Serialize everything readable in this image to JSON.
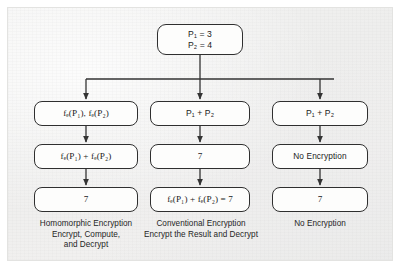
{
  "figure": {
    "background_color": "#f0f0ef",
    "box_border_color": "#2f2f2f",
    "box_fill_color": "#fdfdfc",
    "connector_color": "#333333"
  },
  "root": {
    "line1": "P₁ = 3",
    "line2": "P₂ = 4"
  },
  "columns": [
    {
      "id": "homomorphic",
      "step1": "fₑ(P₁), fₑ(P₂)",
      "step2": "fₑ(P₁) + fₑ(P₂)",
      "step3": "7",
      "caption_line1": "Homomorphic Encryption",
      "caption_line2": "Encrypt, Compute,",
      "caption_line3": "and Decrypt"
    },
    {
      "id": "conventional",
      "step1": "P₁ + P₂",
      "step2": "7",
      "step3": "fₑ(P₁) + fₑ(P₂) = 7",
      "caption_line1": "Conventional Encryption",
      "caption_line2": "Encrypt the Result and Decrypt",
      "caption_line3": ""
    },
    {
      "id": "none",
      "step1": "P₁ + P₂",
      "step2": "No Encryption",
      "step3": "7",
      "caption_line1": "No Encryption",
      "caption_line2": "",
      "caption_line3": ""
    }
  ]
}
